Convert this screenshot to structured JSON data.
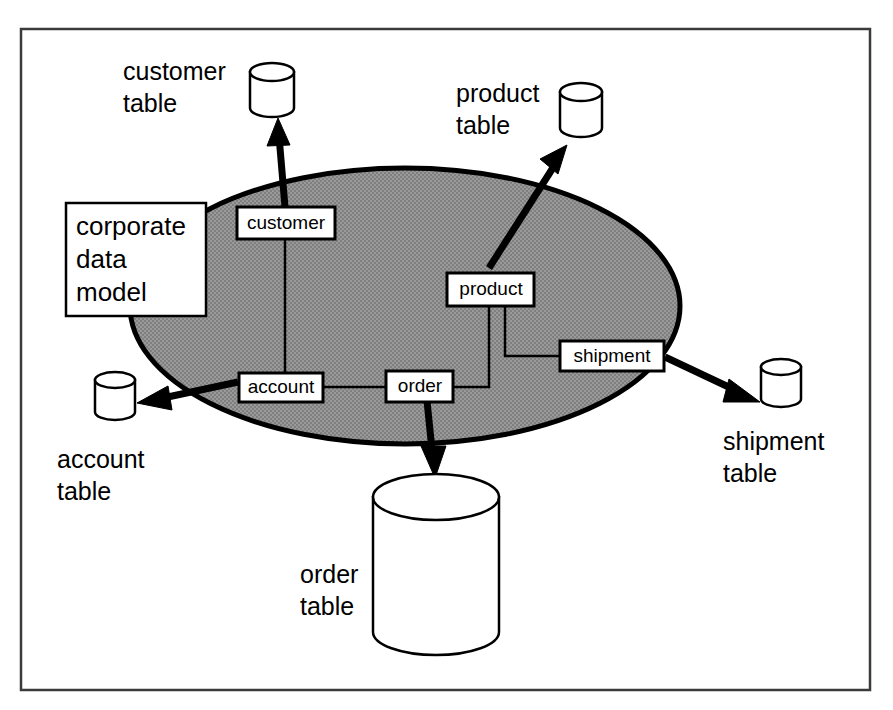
{
  "figure": {
    "colors": {
      "ellipse_fill": "#909090",
      "ellipse_stroke": "#000000",
      "box_fill": "#ffffff",
      "line": "#000000",
      "frame": "#3b3b3b"
    }
  },
  "model_container": {
    "label": "corporate data model",
    "label_lines": [
      "corporate",
      "data",
      "model"
    ]
  },
  "entities": [
    {
      "id": "customer",
      "label": "customer"
    },
    {
      "id": "account",
      "label": "account"
    },
    {
      "id": "order",
      "label": "order"
    },
    {
      "id": "product",
      "label": "product"
    },
    {
      "id": "shipment",
      "label": "shipment"
    }
  ],
  "tables": [
    {
      "id": "customer-table",
      "label": "customer table",
      "label_lines": [
        "customer",
        "table"
      ],
      "size": "small"
    },
    {
      "id": "product-table",
      "label": "product table",
      "label_lines": [
        "product",
        "table"
      ],
      "size": "small"
    },
    {
      "id": "account-table",
      "label": "account table",
      "label_lines": [
        "account",
        "table"
      ],
      "size": "small"
    },
    {
      "id": "shipment-table",
      "label": "shipment table",
      "label_lines": [
        "shipment",
        "table"
      ],
      "size": "small"
    },
    {
      "id": "order-table",
      "label": "order table",
      "label_lines": [
        "order",
        "table"
      ],
      "size": "large"
    }
  ],
  "entity_links": [
    {
      "from": "customer",
      "to": "account"
    },
    {
      "from": "account",
      "to": "order"
    },
    {
      "from": "order",
      "to": "product"
    },
    {
      "from": "product",
      "to": "shipment"
    }
  ],
  "mappings": [
    {
      "from": "customer",
      "to": "customer-table"
    },
    {
      "from": "product",
      "to": "product-table"
    },
    {
      "from": "account",
      "to": "account-table"
    },
    {
      "from": "shipment",
      "to": "shipment-table"
    },
    {
      "from": "order",
      "to": "order-table"
    }
  ]
}
